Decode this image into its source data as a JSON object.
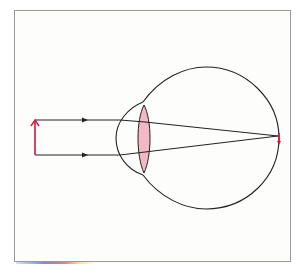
{
  "diagram": {
    "title": "",
    "colors": {
      "frame": "#9a9a9a",
      "background": "#fdfdfb",
      "outline": "#222222",
      "object_arrow": "#d0183c",
      "lens_fill": "#f2b8c4",
      "image_arrow": "#d0183c"
    },
    "elements": [
      {
        "id": "object-arrow",
        "label": "",
        "kind": "upright red arrow (object)"
      },
      {
        "id": "ray-top",
        "label": "",
        "kind": "incoming parallel ray with arrowhead"
      },
      {
        "id": "ray-bottom",
        "label": "",
        "kind": "incoming parallel ray with arrowhead"
      },
      {
        "id": "cornea",
        "label": "",
        "kind": "bulge at front of eye"
      },
      {
        "id": "lens",
        "label": "",
        "kind": "pink biconvex lens"
      },
      {
        "id": "eyeball",
        "label": "",
        "kind": "spherical eyeball outline"
      },
      {
        "id": "image-arrow",
        "label": "",
        "kind": "small inverted red arrow on retina"
      }
    ]
  }
}
